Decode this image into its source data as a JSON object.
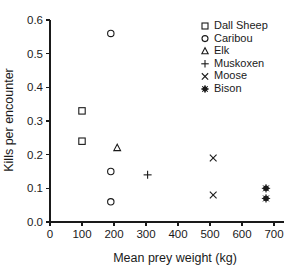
{
  "chart_data": {
    "type": "scatter",
    "title": "",
    "xlabel": "Mean prey weight (kg)",
    "ylabel": "Kills per encounter",
    "xlim": [
      0,
      730
    ],
    "ylim": [
      0.0,
      0.6
    ],
    "xticks": [
      0,
      100,
      200,
      300,
      400,
      500,
      600,
      700
    ],
    "xtick_labels": [
      "0",
      "100",
      "200",
      "300",
      "400",
      "500",
      "600",
      "700"
    ],
    "yticks": [
      0.0,
      0.1,
      0.2,
      0.3,
      0.4,
      0.5,
      0.6
    ],
    "ytick_labels": [
      "0.0",
      "0.1",
      "0.2",
      "0.3",
      "0.4",
      "0.5",
      "0.6"
    ],
    "grid": false,
    "legend_position": "top-right",
    "series": [
      {
        "name": "Dall Sheep",
        "marker": "square-open",
        "color": "#1a1a1a",
        "points": [
          {
            "x": 100,
            "y": 0.33
          },
          {
            "x": 100,
            "y": 0.24
          }
        ]
      },
      {
        "name": "Caribou",
        "marker": "circle-open",
        "color": "#1a1a1a",
        "points": [
          {
            "x": 190,
            "y": 0.56
          },
          {
            "x": 190,
            "y": 0.15
          },
          {
            "x": 190,
            "y": 0.06
          }
        ]
      },
      {
        "name": "Elk",
        "marker": "triangle-open",
        "color": "#1a1a1a",
        "points": [
          {
            "x": 210,
            "y": 0.22
          }
        ]
      },
      {
        "name": "Muskoxen",
        "marker": "plus",
        "color": "#1a1a1a",
        "points": [
          {
            "x": 305,
            "y": 0.14
          }
        ]
      },
      {
        "name": "Moose",
        "marker": "cross",
        "color": "#1a1a1a",
        "points": [
          {
            "x": 510,
            "y": 0.19
          },
          {
            "x": 510,
            "y": 0.08
          }
        ]
      },
      {
        "name": "Bison",
        "marker": "asterisk-filled",
        "color": "#1a1a1a",
        "points": [
          {
            "x": 675,
            "y": 0.1
          },
          {
            "x": 675,
            "y": 0.07
          }
        ]
      }
    ]
  }
}
